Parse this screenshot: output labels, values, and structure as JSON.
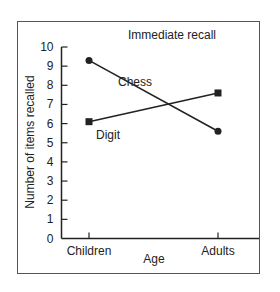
{
  "chart_data": {
    "type": "line",
    "title": "Immediate recall",
    "xlabel": "Age",
    "ylabel": "Number of items recalled",
    "categories": [
      "Children",
      "Adults"
    ],
    "ylim": [
      0,
      10
    ],
    "yticks": [
      0,
      1,
      2,
      3,
      4,
      5,
      6,
      7,
      8,
      9,
      10
    ],
    "grid": false,
    "series": [
      {
        "name": "Chess",
        "marker": "circle",
        "values": [
          9.3,
          5.6
        ],
        "color": "#222222"
      },
      {
        "name": "Digit",
        "marker": "square",
        "values": [
          6.1,
          7.6
        ],
        "color": "#222222"
      }
    ],
    "legend": "inline labels near lines"
  }
}
